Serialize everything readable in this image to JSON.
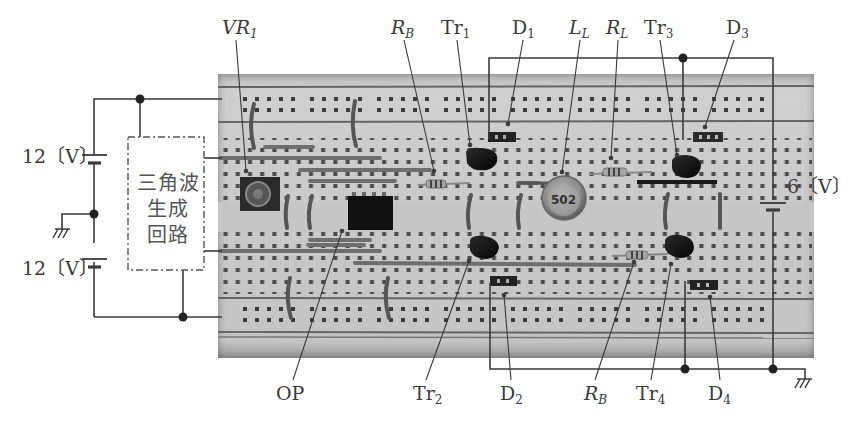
{
  "figure": {
    "type": "breadboard-circuit-photo-with-schematic-annotations",
    "colors": {
      "line": "#3a3a3a",
      "board": "#c9c9c9",
      "component_dark": "#1a1a1a",
      "hole": "#3c3c3c"
    }
  },
  "power_supplies": {
    "upper_battery": {
      "label": "12〔V〕"
    },
    "lower_battery": {
      "label": "12〔V〕"
    },
    "right_battery": {
      "label": "6〔V〕"
    }
  },
  "triangle_wave_block": {
    "lines": [
      "三角波",
      "生成",
      "回路"
    ]
  },
  "inductor_marking": "502",
  "labels": {
    "VR1": {
      "main": "VR",
      "sub": "1"
    },
    "RB_top": {
      "main": "R",
      "sub": "B"
    },
    "Tr1": {
      "main": "Tr",
      "sub": "1"
    },
    "D1": {
      "main": "D",
      "sub": "1"
    },
    "LL": {
      "main": "L",
      "sub": "L"
    },
    "RL": {
      "main": "R",
      "sub": "L"
    },
    "Tr3": {
      "main": "Tr",
      "sub": "3"
    },
    "D3": {
      "main": "D",
      "sub": "3"
    },
    "OP": {
      "main": "OP",
      "sub": ""
    },
    "Tr2": {
      "main": "Tr",
      "sub": "2"
    },
    "D2": {
      "main": "D",
      "sub": "2"
    },
    "RB_bottom": {
      "main": "R",
      "sub": "B"
    },
    "Tr4": {
      "main": "Tr",
      "sub": "4"
    },
    "D4": {
      "main": "D",
      "sub": "4"
    }
  },
  "breadboard_column_markings": [
    "40",
    "35",
    "30",
    "25",
    "20",
    "15",
    "10"
  ]
}
